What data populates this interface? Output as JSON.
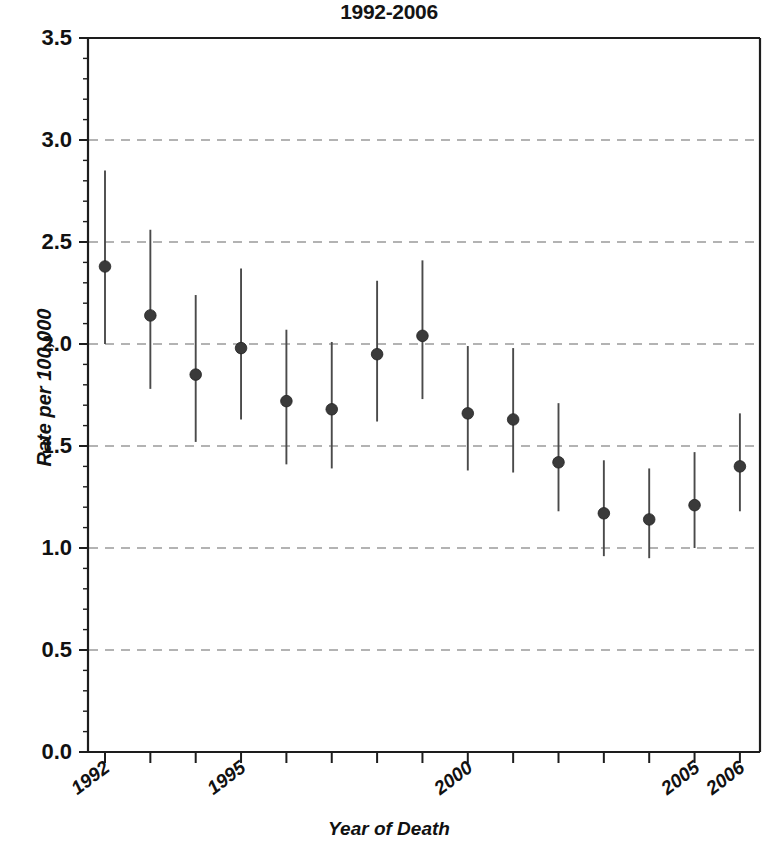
{
  "chart_data": {
    "type": "scatter",
    "title": "1992-2006",
    "xlabel": "Year of Death",
    "ylabel": "Rate per 100,000",
    "ylim": [
      0.0,
      3.5
    ],
    "ytick_labels": [
      "0.0",
      "0.5",
      "1.0",
      "1.5",
      "2.0",
      "2.5",
      "3.0",
      "3.5"
    ],
    "ytick_values": [
      0.0,
      0.5,
      1.0,
      1.5,
      2.0,
      2.5,
      3.0,
      3.5
    ],
    "y_minor_tick_step": 0.1,
    "grid": "horizontal-dashed",
    "gridline_values": [
      0.5,
      1.0,
      1.5,
      2.0,
      2.5,
      3.0
    ],
    "legend": "none",
    "marker": "filled-circle",
    "marker_color": "#3a3a3a",
    "errorbar_color": "#4a4a4a",
    "gridline_color": "#9a9a9a",
    "axis_color": "#1d1d1d",
    "x": [
      1992,
      1993,
      1994,
      1995,
      1996,
      1997,
      1998,
      1999,
      2000,
      2001,
      2002,
      2003,
      2004,
      2005,
      2006
    ],
    "xtick_labels_shown": [
      "1992",
      "1995",
      "2000",
      "2005",
      "2006"
    ],
    "xtick_label_years": [
      1992,
      1995,
      2000,
      2005,
      2006
    ],
    "values": [
      2.38,
      2.14,
      1.85,
      1.98,
      1.72,
      1.68,
      1.95,
      2.04,
      1.66,
      1.63,
      1.42,
      1.17,
      1.14,
      1.21,
      1.4
    ],
    "ci_lower": [
      2.0,
      1.78,
      1.52,
      1.63,
      1.41,
      1.39,
      1.62,
      1.73,
      1.38,
      1.37,
      1.18,
      0.96,
      0.95,
      1.0,
      1.18
    ],
    "ci_upper": [
      2.85,
      2.56,
      2.24,
      2.37,
      2.07,
      2.01,
      2.31,
      2.41,
      1.99,
      1.98,
      1.71,
      1.43,
      1.39,
      1.47,
      1.66
    ]
  }
}
